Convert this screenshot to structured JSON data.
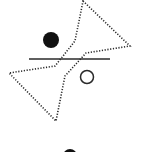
{
  "diagram": {
    "colors": {
      "stroke": "#2a2a2a",
      "background": "#ffffff"
    },
    "shapes": {
      "bowtie": {
        "style": "dotted",
        "upper_points": "83,1 130,46 86,53 63,77",
        "lower_points": "9,73 56,66 75,42 86,53 63,77 56,121"
      },
      "horizontal_line": {
        "x1": 29,
        "y1": 59,
        "x2": 110,
        "y2": 59
      },
      "filled_circle": {
        "cx": 51,
        "cy": 40,
        "r": 8
      },
      "open_circle": {
        "cx": 87,
        "cy": 77,
        "r": 7
      },
      "partial_circle_bottom": {
        "cx": 70,
        "cy": 155,
        "r": 7
      }
    }
  }
}
